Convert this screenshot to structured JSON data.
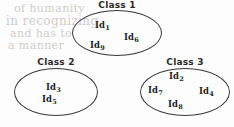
{
  "diagram": {
    "kind": "class-grouping-ellipses",
    "background_color": "#fdfdfd",
    "outline_color": "#3a3a3a",
    "text_color": "#1f1f1f",
    "ghost_text_color": "#cfcdcb",
    "ghost_artifacts": [
      "of humanity",
      "in recognizing",
      "and has to",
      "a manner"
    ],
    "groups": [
      {
        "title": "Class 1",
        "members": [
          {
            "prefix": "Id",
            "subscript": "1"
          },
          {
            "prefix": "Id",
            "subscript": "6"
          },
          {
            "prefix": "Id",
            "subscript": "9"
          }
        ]
      },
      {
        "title": "Class 2",
        "members": [
          {
            "prefix": "Id",
            "subscript": "3"
          },
          {
            "prefix": "Id",
            "subscript": "5"
          }
        ]
      },
      {
        "title": "Class 3",
        "members": [
          {
            "prefix": "Id",
            "subscript": "2"
          },
          {
            "prefix": "Id",
            "subscript": "7"
          },
          {
            "prefix": "Id",
            "subscript": "4"
          },
          {
            "prefix": "Id",
            "subscript": "8"
          }
        ]
      }
    ]
  }
}
